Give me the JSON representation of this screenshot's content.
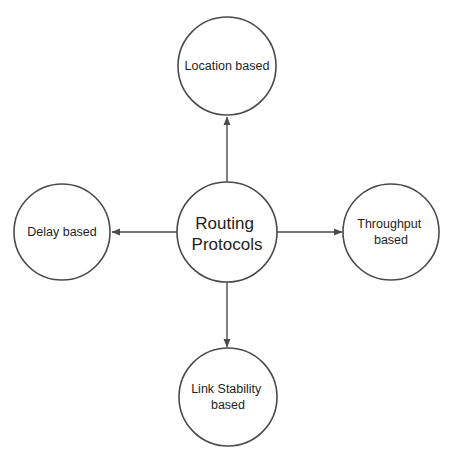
{
  "diagram": {
    "type": "hub-and-spoke",
    "colors": {
      "stroke": "#4a4a4a",
      "fill": "#ffffff",
      "text": "#1e1e1e",
      "background": "#ffffff"
    },
    "center": {
      "id": "routing-protocols",
      "lines": [
        "Routing",
        "Protocols"
      ]
    },
    "nodes": [
      {
        "id": "location",
        "position": "top",
        "lines": [
          "Location based"
        ]
      },
      {
        "id": "delay",
        "position": "left",
        "lines": [
          "Delay based"
        ]
      },
      {
        "id": "throughput",
        "position": "right",
        "lines": [
          "Throughput",
          "based"
        ]
      },
      {
        "id": "link-stability",
        "position": "bottom",
        "lines": [
          "Link Stability",
          "based"
        ]
      }
    ],
    "edges": [
      {
        "from": "routing-protocols",
        "to": "location",
        "direction": "up"
      },
      {
        "from": "routing-protocols",
        "to": "delay",
        "direction": "left"
      },
      {
        "from": "routing-protocols",
        "to": "throughput",
        "direction": "right"
      },
      {
        "from": "routing-protocols",
        "to": "link-stability",
        "direction": "down"
      }
    ]
  }
}
